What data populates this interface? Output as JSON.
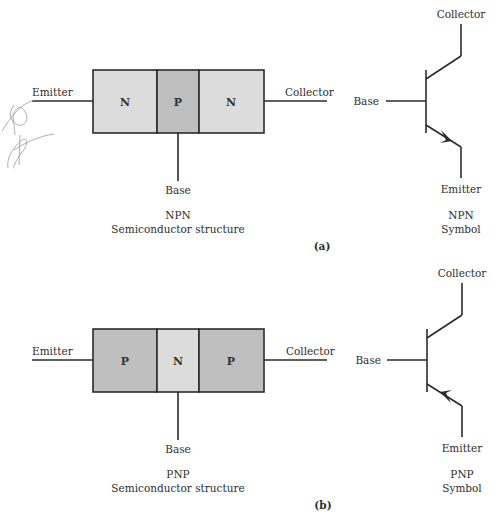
{
  "colors": {
    "n_region": "#dcdcdc",
    "p_region": "#bfbfbf",
    "stroke": "#2b2b2b",
    "text": "#2e2e2e"
  },
  "panel_a": {
    "structure": {
      "segments": [
        "N",
        "P",
        "N"
      ],
      "emitter_label": "Emitter",
      "collector_label": "Collector",
      "base_label": "Base",
      "title": "NPN",
      "subtitle": "Semiconductor structure"
    },
    "symbol": {
      "collector_label": "Collector",
      "base_label": "Base",
      "emitter_label": "Emitter",
      "title": "NPN",
      "subtitle": "Symbol",
      "arrow_direction": "outward"
    },
    "caption": "(a)"
  },
  "panel_b": {
    "structure": {
      "segments": [
        "P",
        "N",
        "P"
      ],
      "emitter_label": "Emitter",
      "collector_label": "Collector",
      "base_label": "Base",
      "title": "PNP",
      "subtitle": "Semiconductor structure"
    },
    "symbol": {
      "collector_label": "Collector",
      "base_label": "Base",
      "emitter_label": "Emitter",
      "title": "PNP",
      "subtitle": "Symbol",
      "arrow_direction": "inward"
    },
    "caption": "(b)"
  }
}
